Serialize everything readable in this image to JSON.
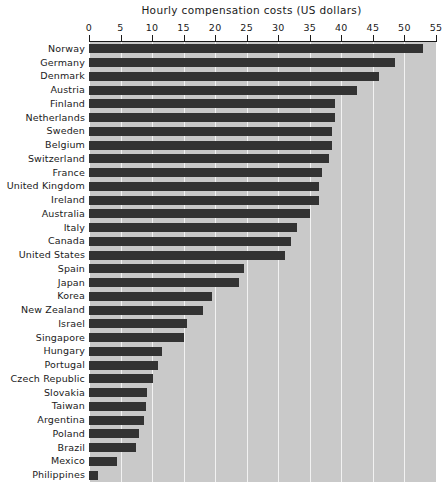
{
  "chart_data": {
    "type": "bar",
    "orientation": "horizontal",
    "title": "Hourly compensation costs (US dollars)",
    "xlabel": "",
    "ylabel": "",
    "xlim": [
      0,
      55
    ],
    "xticks": [
      0,
      5,
      10,
      15,
      20,
      25,
      30,
      35,
      40,
      45,
      50,
      55
    ],
    "grid": true,
    "grid_axis": "x",
    "legend": false,
    "categories": [
      "Norway",
      "Germany",
      "Denmark",
      "Austria",
      "Finland",
      "Netherlands",
      "Sweden",
      "Belgium",
      "Switzerland",
      "France",
      "United Kingdom",
      "Ireland",
      "Australia",
      "Italy",
      "Canada",
      "United States",
      "Spain",
      "Japan",
      "Korea",
      "New Zealand",
      "Israel",
      "Singapore",
      "Hungary",
      "Portugal",
      "Czech Republic",
      "Slovakia",
      "Taiwan",
      "Argentina",
      "Poland",
      "Brazil",
      "Mexico",
      "Philippines"
    ],
    "values": [
      53.0,
      48.5,
      46.0,
      42.5,
      39.0,
      39.0,
      38.5,
      38.5,
      38.0,
      37.0,
      36.5,
      36.5,
      35.0,
      33.0,
      32.0,
      31.0,
      24.5,
      23.8,
      19.5,
      18.0,
      15.5,
      15.0,
      11.5,
      11.0,
      10.2,
      9.2,
      9.0,
      8.7,
      8.0,
      7.5,
      4.5,
      1.5
    ]
  },
  "axis": {
    "tick_labels": [
      "0",
      "5",
      "10",
      "15",
      "20",
      "25",
      "30",
      "35",
      "40",
      "45",
      "50",
      "55"
    ]
  },
  "colors": {
    "bar": "#333333",
    "plot_background": "#c9c9c9",
    "gridline": "#f2f2f2",
    "axis": "#1a1a1a",
    "page_background": "#ffffff"
  },
  "caption": {
    "text": ""
  }
}
